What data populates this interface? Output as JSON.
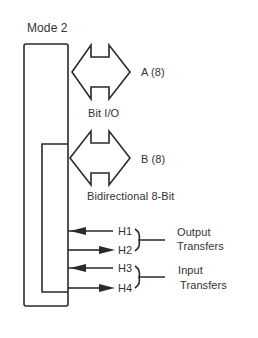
{
  "title": "Mode 2",
  "ports": [
    {
      "id": "A",
      "label": "A (8)"
    },
    {
      "id": "B",
      "label": "B (8)"
    }
  ],
  "captions": {
    "bit_io": "Bit I/O",
    "bidirectional": "Bidirectional 8-Bit"
  },
  "handshake": [
    {
      "label": "H1",
      "direction": "in"
    },
    {
      "label": "H2",
      "direction": "out"
    },
    {
      "label": "H3",
      "direction": "in"
    },
    {
      "label": "H4",
      "direction": "out"
    }
  ],
  "groups": [
    {
      "line1": "Output",
      "line2": "Transfers"
    },
    {
      "line1": "Input",
      "line2": "Transfers"
    }
  ],
  "colors": {
    "stroke": "#2a2a2a",
    "background": "#ffffff"
  }
}
